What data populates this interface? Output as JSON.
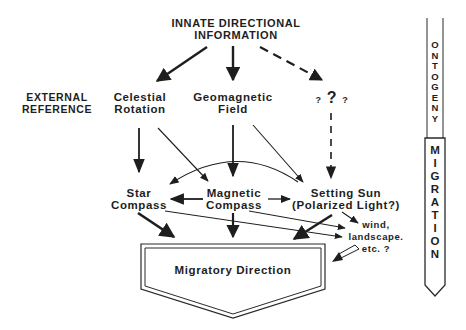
{
  "diagram": {
    "top_title": {
      "line1": "INNATE DIRECTIONAL",
      "line2": "INFORMATION"
    },
    "side_label": {
      "line1": "EXTERNAL",
      "line2": "REFERENCE"
    },
    "references": [
      {
        "line1": "Celestial",
        "line2": "Rotation"
      },
      {
        "line1": "Geomagnetic",
        "line2": "Field"
      },
      {
        "unknown_small_left": "?",
        "unknown_big": "?",
        "unknown_small_right": "?"
      }
    ],
    "compasses": [
      {
        "line1": "Star",
        "line2": "Compass"
      },
      {
        "line1": "Magnetic",
        "line2": "Compass"
      },
      {
        "line1": "Setting Sun",
        "line2": "(Polarized Light?)"
      }
    ],
    "other_cues": {
      "line1": "wind,",
      "line2": "landscape.",
      "line3": "etc.  ?"
    },
    "output": {
      "label": "Migratory Direction"
    },
    "timeline": {
      "upper": [
        "O",
        "N",
        "T",
        "O",
        "G",
        "E",
        "N",
        "Y"
      ],
      "lower": [
        "M",
        "I",
        "G",
        "R",
        "A",
        "T",
        "I",
        "O",
        "N"
      ]
    }
  }
}
